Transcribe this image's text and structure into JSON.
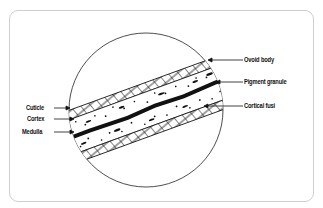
{
  "diagram": {
    "labels_left": [
      {
        "id": "cuticle",
        "text": "Cuticle"
      },
      {
        "id": "cortex",
        "text": "Cortex"
      },
      {
        "id": "medulla",
        "text": "Medulla"
      }
    ],
    "labels_right": [
      {
        "id": "ovoid-body",
        "text": "Ovoid body"
      },
      {
        "id": "pigment-granule",
        "text": "Pigment granule"
      },
      {
        "id": "cortical-fusi",
        "text": "Cortical fusi"
      }
    ],
    "colors": {
      "line": "#111111",
      "frame": "#cfcfcf",
      "background": "#ffffff"
    }
  }
}
